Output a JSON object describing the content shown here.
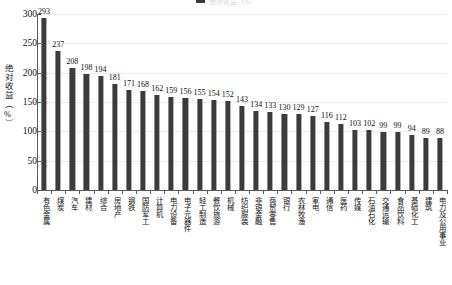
{
  "legend": {
    "series_label": "绝对收益（%）",
    "swatch_color": "#3c3c3c"
  },
  "axes": {
    "ylabel": "绝对收益（%）",
    "yticks": [
      "0",
      "50",
      "100",
      "150",
      "200",
      "250",
      "300"
    ],
    "ymin": 0,
    "ymax": 300
  },
  "chart_data": {
    "type": "bar",
    "title": "",
    "subtitle": "",
    "xlabel": "",
    "ylabel": "绝对收益（%）",
    "ylim": [
      0,
      300
    ],
    "ytick_values": [
      0,
      50,
      100,
      150,
      200,
      250,
      300
    ],
    "grid": true,
    "legend_position": "top-center",
    "bar_color": "#3c3c3c",
    "series": [
      {
        "name": "绝对收益（%）",
        "values": [
          293,
          237,
          208,
          198,
          194,
          181,
          171,
          168,
          162,
          159,
          156,
          155,
          154,
          152,
          143,
          134,
          133,
          130,
          129,
          127,
          116,
          112,
          103,
          102,
          99,
          99,
          94,
          89,
          88
        ]
      }
    ],
    "categories": [
      "有色金属",
      "煤炭",
      "汽车",
      "建材",
      "综合",
      "房地产",
      "钢铁",
      "国防军工",
      "计算机",
      "电力设备",
      "电子元器件",
      "轻工制造",
      "餐饮旅游",
      "机械",
      "纺织服装",
      "非银金融",
      "商贸零售",
      "银行",
      "农林牧渔",
      "家电",
      "通信",
      "医药",
      "传媒",
      "石油石化",
      "交通运输",
      "食品饮料",
      "基础化工",
      "建筑",
      "电力及公用事业"
    ],
    "data_labels": [
      "293",
      "237",
      "208",
      "198",
      "194",
      "181",
      "171",
      "168",
      "162",
      "159",
      "156",
      "155",
      "154",
      "152",
      "143",
      "134",
      "133",
      "130",
      "129",
      "127",
      "116",
      "112",
      "103",
      "102",
      "99",
      "99",
      "94",
      "89",
      "88"
    ]
  }
}
